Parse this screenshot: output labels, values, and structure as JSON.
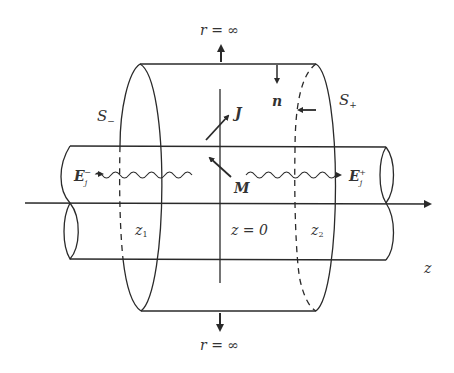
{
  "diagram": {
    "type": "cylindrical waveguide with enclosing surface",
    "colors": {
      "line": "#2a2a2a",
      "background": "#ffffff"
    },
    "labels": {
      "r_inf_top": "r = ∞",
      "r_inf_bottom": "r = ∞",
      "n": "n",
      "J": "J",
      "M": "M",
      "S_minus": "S",
      "S_minus_sub": "−",
      "S_plus": "S",
      "S_plus_sub": "+",
      "E_minus": "E",
      "E_minus_sub": "j",
      "E_minus_sup": "−",
      "E_plus": "E",
      "E_plus_sub": "j",
      "E_plus_sup": "+",
      "z1": "z",
      "z1_sub": "1",
      "z2": "z",
      "z2_sub": "2",
      "z0": "z = 0",
      "z_axis": "z"
    }
  }
}
